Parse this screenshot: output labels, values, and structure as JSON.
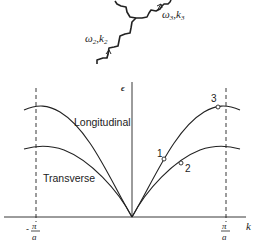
{
  "figure": {
    "phonons": {
      "incoming_label_omega": "ω",
      "incoming_sub": "2",
      "incoming_label_k": "k",
      "incoming_k_sub": "2",
      "outgoing_label_omega": "ω",
      "outgoing_sub": "3",
      "outgoing_label_k": "k",
      "outgoing_k_sub": "3",
      "separator": ","
    },
    "axes": {
      "y_label": "ϵ",
      "x_label": "k",
      "left_tick_sign": "-",
      "tick_num": "π",
      "tick_den": "a"
    },
    "branches": {
      "longitudinal": "Longitudinal",
      "transverse": "Transverse"
    },
    "points": [
      {
        "label": "1"
      },
      {
        "label": "2"
      },
      {
        "label": "3"
      }
    ],
    "colors": {
      "ink": "#222222",
      "background": "#ffffff"
    }
  }
}
